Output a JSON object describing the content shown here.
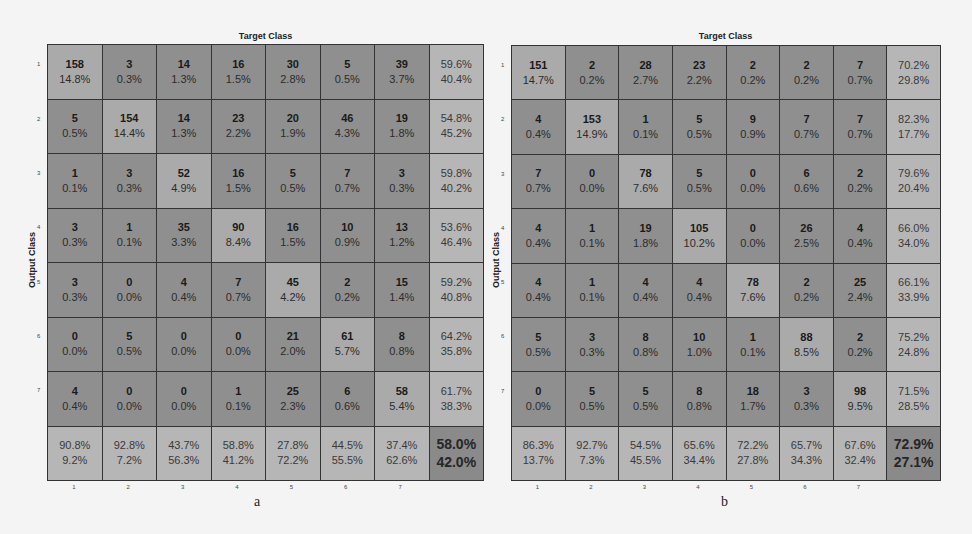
{
  "chart_data": [
    {
      "type": "heatmap",
      "panel": "a",
      "title": "Target Class",
      "xlabel": "Target Class",
      "ylabel": "Output Class",
      "x_tick_labels": [
        "1",
        "2",
        "3",
        "4",
        "5",
        "6",
        "7"
      ],
      "y_tick_labels": [
        "1",
        "2",
        "3",
        "4",
        "5",
        "6",
        "7"
      ],
      "matrix_counts": [
        [
          158,
          3,
          14,
          16,
          30,
          5,
          39
        ],
        [
          5,
          154,
          14,
          23,
          20,
          46,
          19
        ],
        [
          1,
          3,
          52,
          16,
          5,
          7,
          3
        ],
        [
          3,
          1,
          35,
          90,
          16,
          10,
          13
        ],
        [
          3,
          0,
          4,
          7,
          45,
          2,
          15
        ],
        [
          0,
          5,
          0,
          0,
          21,
          61,
          8
        ],
        [
          4,
          0,
          0,
          1,
          25,
          6,
          58
        ]
      ],
      "matrix_percent": [
        [
          "14.8%",
          "0.3%",
          "1.3%",
          "1.5%",
          "2.8%",
          "0.5%",
          "3.7%"
        ],
        [
          "0.5%",
          "14.4%",
          "1.3%",
          "2.2%",
          "1.9%",
          "4.3%",
          "1.8%"
        ],
        [
          "0.1%",
          "0.3%",
          "4.9%",
          "1.5%",
          "0.5%",
          "0.7%",
          "0.3%"
        ],
        [
          "0.3%",
          "0.1%",
          "3.3%",
          "8.4%",
          "1.5%",
          "0.9%",
          "1.2%"
        ],
        [
          "0.3%",
          "0.0%",
          "0.4%",
          "0.7%",
          "4.2%",
          "0.2%",
          "1.4%"
        ],
        [
          "0.0%",
          "0.5%",
          "0.0%",
          "0.0%",
          "2.0%",
          "5.7%",
          "0.8%"
        ],
        [
          "0.4%",
          "0.0%",
          "0.0%",
          "0.1%",
          "2.3%",
          "0.6%",
          "5.4%"
        ]
      ],
      "row_summary": [
        [
          "59.6%",
          "40.4%"
        ],
        [
          "54.8%",
          "45.2%"
        ],
        [
          "59.8%",
          "40.2%"
        ],
        [
          "53.6%",
          "46.4%"
        ],
        [
          "59.2%",
          "40.8%"
        ],
        [
          "64.2%",
          "35.8%"
        ],
        [
          "61.7%",
          "38.3%"
        ]
      ],
      "col_summary": [
        [
          "90.8%",
          "9.2%"
        ],
        [
          "92.8%",
          "7.2%"
        ],
        [
          "43.7%",
          "56.3%"
        ],
        [
          "58.8%",
          "41.2%"
        ],
        [
          "27.8%",
          "72.2%"
        ],
        [
          "44.5%",
          "55.5%"
        ],
        [
          "37.4%",
          "62.6%"
        ]
      ],
      "overall": [
        "58.0%",
        "42.0%"
      ],
      "caption": "a"
    },
    {
      "type": "heatmap",
      "panel": "b",
      "title": "Target Class",
      "xlabel": "Target Class",
      "ylabel": "Output Class",
      "x_tick_labels": [
        "1",
        "2",
        "3",
        "4",
        "5",
        "6",
        "7"
      ],
      "y_tick_labels": [
        "1",
        "2",
        "3",
        "4",
        "5",
        "6",
        "7"
      ],
      "matrix_counts": [
        [
          151,
          2,
          28,
          23,
          2,
          2,
          7
        ],
        [
          4,
          153,
          1,
          5,
          9,
          7,
          7
        ],
        [
          7,
          0,
          78,
          5,
          0,
          6,
          2
        ],
        [
          4,
          1,
          19,
          105,
          0,
          26,
          4
        ],
        [
          4,
          1,
          4,
          4,
          78,
          2,
          25
        ],
        [
          5,
          3,
          8,
          10,
          1,
          88,
          2
        ],
        [
          0,
          5,
          5,
          8,
          18,
          3,
          98
        ]
      ],
      "matrix_percent": [
        [
          "14.7%",
          "0.2%",
          "2.7%",
          "2.2%",
          "0.2%",
          "0.2%",
          "0.7%"
        ],
        [
          "0.4%",
          "14.9%",
          "0.1%",
          "0.5%",
          "0.9%",
          "0.7%",
          "0.7%"
        ],
        [
          "0.7%",
          "0.0%",
          "7.6%",
          "0.5%",
          "0.0%",
          "0.6%",
          "0.2%"
        ],
        [
          "0.4%",
          "0.1%",
          "1.8%",
          "10.2%",
          "0.0%",
          "2.5%",
          "0.4%"
        ],
        [
          "0.4%",
          "0.1%",
          "0.4%",
          "0.4%",
          "7.6%",
          "0.2%",
          "2.4%"
        ],
        [
          "0.5%",
          "0.3%",
          "0.8%",
          "1.0%",
          "0.1%",
          "8.5%",
          "0.2%"
        ],
        [
          "0.0%",
          "0.5%",
          "0.5%",
          "0.8%",
          "1.7%",
          "0.3%",
          "9.5%"
        ]
      ],
      "row_summary": [
        [
          "70.2%",
          "29.8%"
        ],
        [
          "82.3%",
          "17.7%"
        ],
        [
          "79.6%",
          "20.4%"
        ],
        [
          "66.0%",
          "34.0%"
        ],
        [
          "66.1%",
          "33.9%"
        ],
        [
          "75.2%",
          "24.8%"
        ],
        [
          "71.5%",
          "28.5%"
        ]
      ],
      "col_summary": [
        [
          "86.3%",
          "13.7%"
        ],
        [
          "92.7%",
          "7.3%"
        ],
        [
          "54.5%",
          "45.5%"
        ],
        [
          "65.6%",
          "34.4%"
        ],
        [
          "72.2%",
          "27.8%"
        ],
        [
          "65.7%",
          "34.3%"
        ],
        [
          "67.6%",
          "32.4%"
        ]
      ],
      "overall": [
        "72.9%",
        "27.1%"
      ],
      "caption": "b"
    }
  ],
  "colors": {
    "diagonal": "#aaaaaa",
    "off_diagonal": "#8f8f8f",
    "summary": "#b6b6b6",
    "overall": "#8a8a8a",
    "grid_line": "#333333"
  }
}
